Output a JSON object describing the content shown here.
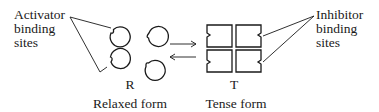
{
  "diagram": {
    "left_label": {
      "lines": [
        "Activator",
        "binding",
        "sites"
      ]
    },
    "right_label": {
      "lines": [
        "Inhibitor",
        "binding",
        "sites"
      ]
    },
    "relaxed": {
      "letter": "R",
      "caption": "Relaxed form",
      "subunit_shape": "circle",
      "subunit_count": 4
    },
    "tense": {
      "letter": "T",
      "caption": "Tense form",
      "subunit_shape": "square",
      "subunit_count": 4
    },
    "equilibrium": {
      "forward_arrow": "arrow-right",
      "reverse_arrow": "arrow-left"
    },
    "colors": {
      "ink": "#1a1a1a",
      "background": "#ffffff"
    }
  }
}
